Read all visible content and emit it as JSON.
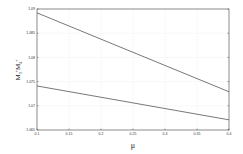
{
  "chart_data": {
    "type": "line",
    "title": "",
    "xlabel": "μ",
    "ylabel": "M3+M4+",
    "xlim": [
      0.1,
      0.4
    ],
    "ylim": [
      1.065,
      1.09
    ],
    "grid": true,
    "legend": null,
    "x_ticks": [
      "0.1",
      "0.15",
      "0.2",
      "0.25",
      "0.3",
      "0.35",
      "0.4"
    ],
    "y_ticks": [
      "1.065",
      "1.07",
      "1.075",
      "1.08",
      "1.085",
      "1.09"
    ],
    "x": [
      0.1,
      0.4
    ],
    "series": [
      {
        "name": "upper",
        "values": [
          1.0892,
          1.0729
        ],
        "color": "#555555"
      },
      {
        "name": "lower",
        "values": [
          1.0741,
          1.0671
        ],
        "color": "#555555"
      }
    ]
  },
  "labels": {
    "xlabel": "μ",
    "ylabel_main": "M",
    "ylabel_sub1": "3",
    "ylabel_sup1": "+",
    "ylabel_main2": "M",
    "ylabel_sub2": "4",
    "ylabel_sup2": "+"
  }
}
